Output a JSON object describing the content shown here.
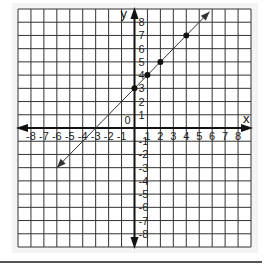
{
  "chart_data": {
    "type": "line",
    "title": "",
    "xlabel": "x",
    "ylabel": "y",
    "origin_label": "0",
    "xlim": [
      -9,
      9
    ],
    "ylim": [
      -9,
      9
    ],
    "grid": true,
    "x_ticks": [
      -8,
      -7,
      -6,
      -5,
      -4,
      -3,
      -2,
      -1,
      1,
      2,
      3,
      4,
      5,
      6,
      7,
      8
    ],
    "y_ticks": [
      -8,
      -7,
      -6,
      -5,
      -4,
      -3,
      -2,
      -1,
      1,
      2,
      3,
      4,
      5,
      6,
      7,
      8
    ],
    "x_tick_labels": [
      "-8",
      "-7",
      "-6",
      "-5",
      "-4",
      "-3",
      "-2",
      "-1",
      "1",
      "2",
      "3",
      "4",
      "5",
      "6",
      "7",
      "8"
    ],
    "y_tick_labels": [
      "-8",
      "-7",
      "-6",
      "-5",
      "-4",
      "-3",
      "-2",
      "-1",
      "1",
      "2",
      "3",
      "4",
      "5",
      "6",
      "7",
      "8"
    ],
    "series": [
      {
        "name": "y = x + 3",
        "line": {
          "slope": 1,
          "intercept": 3,
          "x_start": -6,
          "x_end": 5.8,
          "arrows": "both"
        },
        "points": [
          {
            "x": 0,
            "y": 3
          },
          {
            "x": 1,
            "y": 4
          },
          {
            "x": 2,
            "y": 5
          },
          {
            "x": 4,
            "y": 7
          }
        ]
      }
    ]
  },
  "colors": {
    "grid": "#333333",
    "axis": "#111111",
    "line": "#333333",
    "point": "#111111",
    "background": "#f4f4f4"
  }
}
